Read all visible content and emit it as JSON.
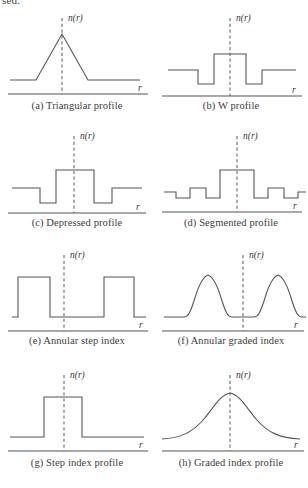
{
  "page": {
    "clipped_text_above": "sed.",
    "axis_label_vertical": "n(r)",
    "axis_label_horizontal": "r"
  },
  "panels": [
    {
      "key": "a",
      "caption": "(a) Triangular profile",
      "shape": "triangular",
      "points": "10,72 36,72 62,26 88,72 140,72"
    },
    {
      "key": "b",
      "caption": "(b) W profile",
      "shape": "w-profile",
      "points": "14,62 44,62 44,76 60,76 60,46 92,46 92,76 108,76 108,62 142,62"
    },
    {
      "key": "c",
      "caption": "(c) Depressed profile",
      "shape": "depressed",
      "points": "12,62 40,62 40,77 56,77 56,44 94,44 94,77 112,77 112,62 142,62"
    },
    {
      "key": "d",
      "caption": "(d) Segmented profile",
      "shape": "segmented",
      "points": "10,66 22,66 22,72 36,72 36,62 52,62 52,72 66,72 66,44 100,44 100,72 114,72 114,62 130,62 130,72 144,72 144,66 152,66"
    },
    {
      "key": "e",
      "caption": "(e) Annular step index",
      "shape": "annular-step",
      "points": "12,74 18,74 18,34 50,34 50,74 104,74 104,34 134,34 134,74 146,74"
    },
    {
      "key": "f",
      "caption": "(f) Annular graded index",
      "shape": "annular-graded",
      "path": "M10,74 L30,74 C34,74 36,70 40,58 C44,44 48,34 54,32 C60,34 64,44 68,58 C72,70 74,74 78,74 L100,74 C104,74 106,70 110,58 C114,44 118,34 124,32 C130,34 134,44 138,58 C142,70 144,74 148,74 L152,74"
    },
    {
      "key": "g",
      "caption": "(g) Step index profile",
      "shape": "step-index",
      "points": "10,76 44,76 44,36 82,36 82,76 144,76"
    },
    {
      "key": "h",
      "caption": "(h) Graded index profile",
      "shape": "graded-index",
      "path": "M8,78 C26,77 38,72 50,58 C60,46 66,34 76,32 C86,34 92,46 102,58 C114,72 126,77 146,78"
    }
  ]
}
